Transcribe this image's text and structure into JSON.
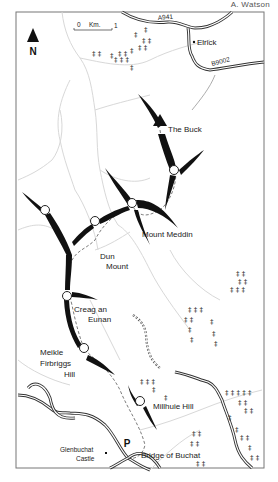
{
  "credit": "A. Watson",
  "north": {
    "label": "N",
    "icon": "north-arrow-icon"
  },
  "scale": {
    "start": "0",
    "unit": "Km.",
    "end": "1"
  },
  "roads": [
    {
      "id": "a941",
      "label": "A941"
    },
    {
      "id": "b9002",
      "label": "B9002"
    }
  ],
  "places": {
    "elrick": "Elrick",
    "glenbuchat_castle_line1": "Glenbuchat",
    "glenbuchat_castle_line2": "Castle",
    "bridge_of_buchat": "Bridge of Buchat",
    "parking": "P"
  },
  "summits": [
    {
      "id": "the-buck",
      "label": "The Buck",
      "marker": "triangle"
    },
    {
      "id": "mount-meddin",
      "label": "Mount Meddin",
      "marker": "circle"
    },
    {
      "id": "dun-mount",
      "line1": "Dun",
      "line2": "Mount",
      "marker": "circle"
    },
    {
      "id": "creag-an-eunan",
      "line1": "Creag an",
      "line2": "Eunan",
      "marker": "circle"
    },
    {
      "id": "meikle-firbriggs-hill",
      "line1": "Meikle",
      "line2": "Firbriggs",
      "line3": "Hill",
      "marker": "circle"
    },
    {
      "id": "millhuie-hill",
      "label": "Millhuie Hill",
      "marker": "circle"
    }
  ],
  "colors": {
    "ridge": "#111111",
    "road": "#333333",
    "stream": "#d6d6d6",
    "frame": "#666666",
    "route": "#555555"
  }
}
